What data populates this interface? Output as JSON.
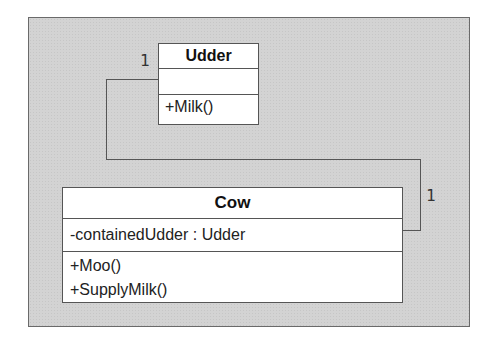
{
  "diagram": {
    "type": "uml-class-diagram",
    "classes": [
      {
        "name": "Udder",
        "attributes": [],
        "methods": [
          "+Milk()"
        ]
      },
      {
        "name": "Cow",
        "attributes": [
          "-containedUdder : Udder"
        ],
        "methods": [
          "+Moo()",
          "+SupplyMilk()"
        ]
      }
    ],
    "associations": [
      {
        "from": "Cow",
        "to": "Udder",
        "from_multiplicity": "1",
        "to_multiplicity": "1"
      }
    ]
  },
  "colors": {
    "frame_background": "#d3d3d3",
    "frame_border": "#6a6a6a",
    "line": "#555555",
    "class_fill": "#ffffff"
  }
}
